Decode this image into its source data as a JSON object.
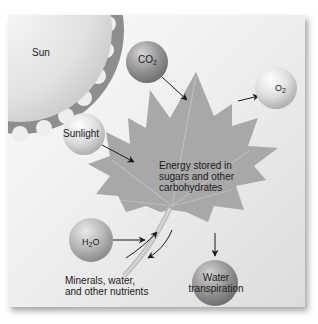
{
  "diagram": {
    "nodes": {
      "sun": {
        "label": "Sun"
      },
      "sunlight": {
        "label": "Sunlight"
      },
      "co2": {
        "label": "CO",
        "sub": "2"
      },
      "o2": {
        "label": "O",
        "sub": "2"
      },
      "h2o": {
        "pre": "H",
        "sub": "2",
        "post": "O"
      },
      "leaf": {
        "line1": "Energy stored in",
        "line2": "sugars and other",
        "line3": "carbohydrates"
      },
      "minerals": {
        "line1": "Minerals, water,",
        "line2": "and other nutrients"
      },
      "transpiration": {
        "line1": "Water",
        "line2": "transpiration"
      }
    },
    "edges": [
      {
        "from": "sunlight",
        "to": "leaf"
      },
      {
        "from": "co2",
        "to": "leaf"
      },
      {
        "from": "leaf",
        "to": "o2"
      },
      {
        "from": "h2o",
        "to": "leaf"
      },
      {
        "from": "minerals",
        "to": "leaf"
      },
      {
        "from": "leaf",
        "to": "stem-down"
      },
      {
        "from": "leaf",
        "to": "transpiration"
      }
    ],
    "colors": {
      "sun": "#e6e6e6",
      "sun_rays": "#8c8c8c",
      "leaf": "#a6a6a6",
      "sphere_light": "#e8e8e8",
      "sphere_dark": "#8a8a8a",
      "arrow": "#1a1a1a"
    }
  }
}
